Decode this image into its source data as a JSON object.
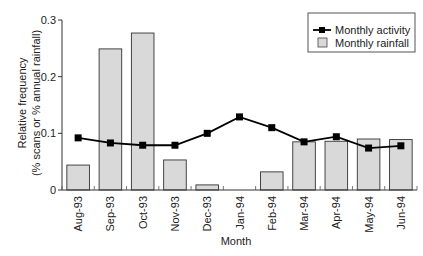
{
  "chart_data": {
    "type": "bar+line",
    "title": "",
    "xlabel": "Month",
    "ylabel": "Relative frequency",
    "ylabel2": "(% scans or % annual rainfall)",
    "ylim": [
      0,
      0.3
    ],
    "yticks": [
      "0",
      "0.1",
      "0.2",
      "0.3"
    ],
    "grid": false,
    "legend_position": "top-right",
    "categories": [
      "Aug-93",
      "Sep-93",
      "Oct-93",
      "Nov-93",
      "Dec-93",
      "Jan-94",
      "Feb-94",
      "Mar-94",
      "Apr-94",
      "May-94",
      "Jun-94"
    ],
    "series": [
      {
        "name": "Monthly activity",
        "type": "line",
        "marker": "square",
        "color": "#000000",
        "values": [
          0.092,
          0.083,
          0.079,
          0.079,
          0.1,
          0.129,
          0.11,
          0.085,
          0.094,
          0.074,
          0.078
        ]
      },
      {
        "name": "Monthly rainfall",
        "type": "bar",
        "color": "#d9d9d9",
        "values": [
          0.044,
          0.249,
          0.277,
          0.053,
          0.009,
          0.0,
          0.032,
          0.085,
          0.086,
          0.09,
          0.089
        ]
      }
    ]
  },
  "legend": {
    "activity_label": "Monthly activity",
    "rainfall_label": "Monthly rainfall"
  },
  "colors": {
    "bar_fill": "#d9d9d9",
    "bar_stroke": "#333333",
    "line": "#000000"
  }
}
